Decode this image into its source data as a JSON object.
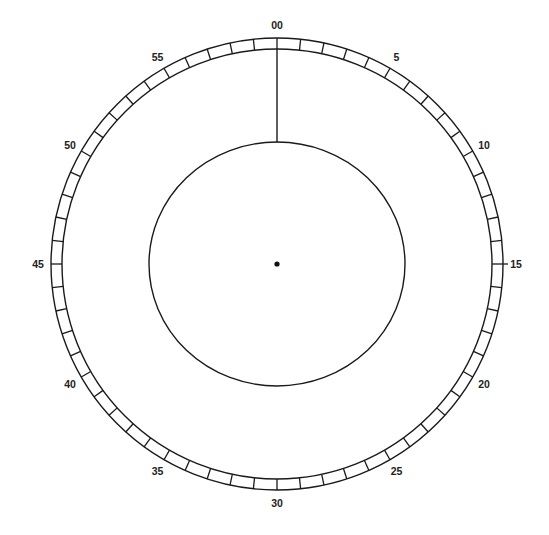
{
  "diagram": {
    "title": "",
    "type": "clock-dial",
    "colors": {
      "line": "#1a1a1a",
      "label": "#222222",
      "background": "#ffffff"
    },
    "center": {
      "x": 277,
      "y": 264
    },
    "outer_ring": {
      "outer_radius": 226,
      "inner_radius": 215,
      "divisions": 60
    },
    "inner_circle": {
      "rx": 128,
      "ry": 122
    },
    "hand": {
      "value": 0,
      "label": "00"
    },
    "labels": [
      {
        "value": 0,
        "text": "00"
      },
      {
        "value": 5,
        "text": "5"
      },
      {
        "value": 10,
        "text": "10"
      },
      {
        "value": 15,
        "text": "15"
      },
      {
        "value": 20,
        "text": "20"
      },
      {
        "value": 25,
        "text": "25"
      },
      {
        "value": 30,
        "text": "30"
      },
      {
        "value": 35,
        "text": "35"
      },
      {
        "value": 40,
        "text": "40"
      },
      {
        "value": 45,
        "text": "45"
      },
      {
        "value": 50,
        "text": "50"
      },
      {
        "value": 55,
        "text": "55"
      }
    ]
  }
}
